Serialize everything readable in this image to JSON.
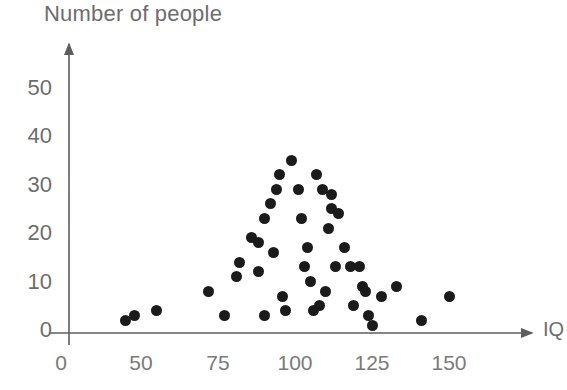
{
  "chart_data": {
    "type": "scatter",
    "title": "",
    "xlabel": "IQ",
    "ylabel": "Number of people",
    "xticks": [
      0,
      50,
      75,
      100,
      125,
      150
    ],
    "xtick_labels": [
      "0",
      "50",
      "75",
      "100",
      "125",
      "150"
    ],
    "yticks": [
      0,
      10,
      20,
      30,
      40,
      50
    ],
    "ytick_labels": [
      "0",
      "10",
      "20",
      "30",
      "40",
      "50"
    ],
    "xlim": [
      0,
      160
    ],
    "ylim": [
      0,
      55
    ],
    "grid": false,
    "legend": false,
    "axis_style": "arrow-axes",
    "broken_x_axis": true,
    "marker_color": "#1b1b1b",
    "axis_color": "#6d6d6d",
    "points": [
      {
        "x": 40,
        "y": 2
      },
      {
        "x": 46,
        "y": 3
      },
      {
        "x": 55,
        "y": 4
      },
      {
        "x": 72,
        "y": 8
      },
      {
        "x": 77,
        "y": 3
      },
      {
        "x": 81,
        "y": 11
      },
      {
        "x": 82,
        "y": 14
      },
      {
        "x": 86,
        "y": 19
      },
      {
        "x": 88,
        "y": 12
      },
      {
        "x": 88,
        "y": 18
      },
      {
        "x": 90,
        "y": 3
      },
      {
        "x": 90,
        "y": 23
      },
      {
        "x": 92,
        "y": 26
      },
      {
        "x": 93,
        "y": 16
      },
      {
        "x": 94,
        "y": 29
      },
      {
        "x": 95,
        "y": 32
      },
      {
        "x": 96,
        "y": 7
      },
      {
        "x": 97,
        "y": 4
      },
      {
        "x": 99,
        "y": 35
      },
      {
        "x": 101,
        "y": 29
      },
      {
        "x": 102,
        "y": 23
      },
      {
        "x": 103,
        "y": 13
      },
      {
        "x": 104,
        "y": 17
      },
      {
        "x": 105,
        "y": 10
      },
      {
        "x": 106,
        "y": 4
      },
      {
        "x": 107,
        "y": 32
      },
      {
        "x": 108,
        "y": 5
      },
      {
        "x": 109,
        "y": 29
      },
      {
        "x": 110,
        "y": 8
      },
      {
        "x": 111,
        "y": 21
      },
      {
        "x": 112,
        "y": 28
      },
      {
        "x": 112,
        "y": 25
      },
      {
        "x": 113,
        "y": 13
      },
      {
        "x": 114,
        "y": 24
      },
      {
        "x": 116,
        "y": 17
      },
      {
        "x": 118,
        "y": 13
      },
      {
        "x": 119,
        "y": 5
      },
      {
        "x": 121,
        "y": 13
      },
      {
        "x": 122,
        "y": 9
      },
      {
        "x": 123,
        "y": 8
      },
      {
        "x": 124,
        "y": 3
      },
      {
        "x": 125,
        "y": 1
      },
      {
        "x": 128,
        "y": 7
      },
      {
        "x": 133,
        "y": 9
      },
      {
        "x": 141,
        "y": 2
      },
      {
        "x": 150,
        "y": 7
      }
    ]
  },
  "geometry": {
    "plot": {
      "x_origin_px": 61,
      "x50_px": 141,
      "px_per_25_units": 77,
      "y_zero_px": 330,
      "px_per_10_units": 48.5
    }
  }
}
